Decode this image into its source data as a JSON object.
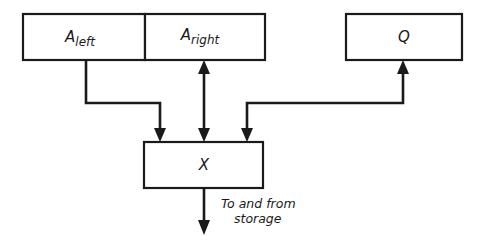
{
  "diagram": {
    "type": "register-transfer block diagram",
    "nodes": [
      {
        "id": "A_left",
        "label_main": "A",
        "label_sub": "left"
      },
      {
        "id": "A_right",
        "label_main": "A",
        "label_sub": "right"
      },
      {
        "id": "Q",
        "label_main": "Q"
      },
      {
        "id": "X",
        "label_main": "X"
      }
    ],
    "edges": [
      {
        "from": "A_left",
        "to": "X",
        "direction": "one-way"
      },
      {
        "from": "A_right",
        "to": "X",
        "direction": "two-way"
      },
      {
        "from": "X",
        "to": "Q",
        "direction": "one-way"
      },
      {
        "from": "X",
        "to": "storage",
        "direction": "two-way"
      }
    ],
    "storage_label_line1": "To and from",
    "storage_label_line2": "storage",
    "colors": {
      "ink": "#1a1a1a",
      "background": "#ffffff"
    }
  }
}
